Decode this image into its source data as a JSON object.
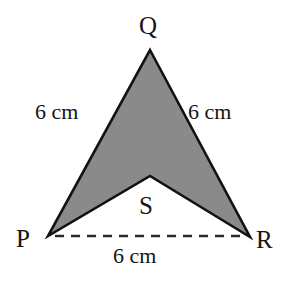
{
  "figure": {
    "kind": "geometry-diagram",
    "shape_name": "arrowhead-quadrilateral-PQRS",
    "background_color": "#ffffff",
    "fill_color": "#8a8a8a",
    "stroke_color": "#121212",
    "stroke_width": 2.6,
    "dash_color": "#2a2a2a",
    "vertices": [
      {
        "id": "Q",
        "label": "Q",
        "x": 150,
        "y": 50
      },
      {
        "id": "R",
        "label": "R",
        "x": 250,
        "y": 237
      },
      {
        "id": "S",
        "label": "S",
        "x": 150,
        "y": 176
      },
      {
        "id": "P",
        "label": "P",
        "x": 48,
        "y": 236
      }
    ],
    "polygon_points": "150,50 250,237 150,176 48,236",
    "dashed_segment": {
      "name": "PR",
      "x1": 55,
      "y1": 236,
      "x2": 244,
      "y2": 236,
      "dash_pattern": "9 7"
    },
    "measures": {
      "side_pq": "6 cm",
      "side_qr": "6 cm",
      "side_pr": "6 cm"
    }
  }
}
